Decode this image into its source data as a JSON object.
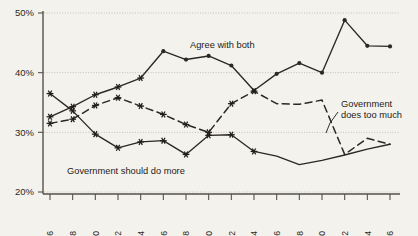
{
  "chart_data": {
    "type": "line",
    "title": "",
    "xlabel": "",
    "ylabel": "",
    "grid": "horizontal-dotted",
    "legend": "inline-annotations",
    "ylim": [
      20,
      50
    ],
    "yticks": [
      20,
      30,
      40,
      50
    ],
    "ytick_labels": [
      "20%",
      "30%",
      "40%",
      "50%"
    ],
    "x": [
      1976,
      1978,
      1980,
      1982,
      1984,
      1986,
      1988,
      1990,
      1992,
      1994,
      1996,
      1998,
      2000,
      2002,
      2004,
      2006
    ],
    "xtick_labels": [
      "1976",
      "1978",
      "1980",
      "1982",
      "1984",
      "1986",
      "1988",
      "1990",
      "1992",
      "1994",
      "1996",
      "1998",
      "2000",
      "2002",
      "2004",
      "2006"
    ],
    "series": [
      {
        "name": "Agree with both",
        "style": "solid",
        "marker": "mixed-star-then-diamond",
        "values": [
          32.6,
          34.3,
          36.3,
          37.6,
          39.1,
          43.6,
          42.2,
          42.8,
          41.2,
          37.0,
          39.8,
          41.6,
          40.0,
          48.8,
          44.5,
          44.4
        ]
      },
      {
        "name": "Government should do more",
        "style": "solid",
        "marker": "mixed-star-then-none",
        "values": [
          36.5,
          33.6,
          29.7,
          27.4,
          28.4,
          28.6,
          26.3,
          29.5,
          29.6,
          26.8,
          26.0,
          24.6,
          25.3,
          26.2,
          27.2,
          28.0
        ]
      },
      {
        "name": "Government does too much",
        "style": "dashed",
        "marker": "mixed-star-then-none",
        "values": [
          31.5,
          32.2,
          34.5,
          35.8,
          34.4,
          33.0,
          31.3,
          30.0,
          34.8,
          36.9,
          34.8,
          34.7,
          35.4,
          26.3,
          29.0,
          28.0
        ]
      }
    ],
    "annotations": [
      {
        "id": "agree-with-both",
        "text": "Agree with both"
      },
      {
        "id": "government-does-too-much",
        "text": "Government does too much"
      },
      {
        "id": "government-should-do-more",
        "text": "Government should do more"
      }
    ],
    "colors": {
      "background": "#f4f2ec",
      "line": "#2b2825",
      "axis": "#55514c",
      "grid": "#b9b4aa",
      "text": "#1e1c1a"
    }
  },
  "annotation_lines": {
    "does_too_much_line1": "Government",
    "does_too_much_line2": "does too much"
  }
}
